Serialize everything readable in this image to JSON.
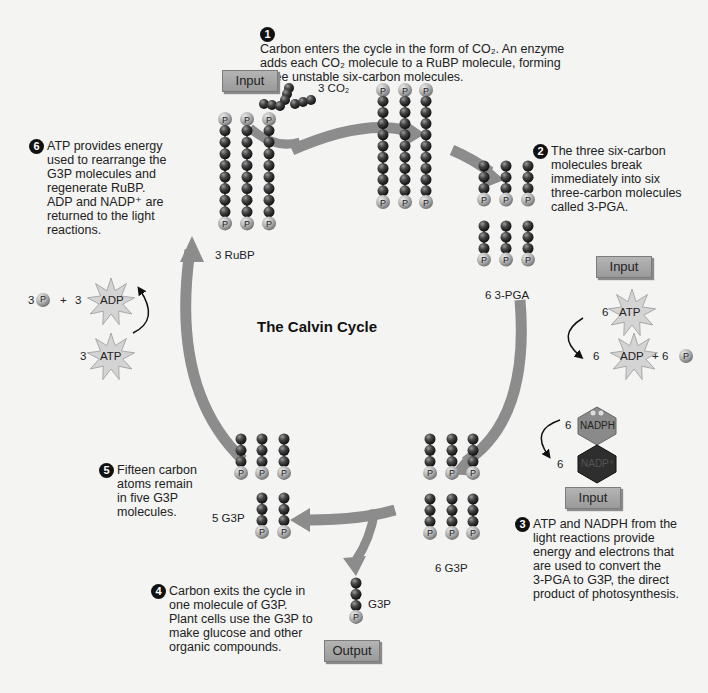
{
  "title": "The Calvin Cycle",
  "steps": [
    {
      "num": "1",
      "lines": [
        "Carbon enters the cycle in the form of CO₂. An enzyme",
        "adds each CO₂ molecule to a RuBP molecule, forming",
        "three unstable six-carbon molecules."
      ]
    },
    {
      "num": "2",
      "lines": [
        "The three six-carbon",
        "molecules break",
        "immediately into six",
        "three-carbon molecules",
        "called 3-PGA."
      ]
    },
    {
      "num": "3",
      "lines": [
        "ATP and NADPH from the",
        "light reactions provide",
        "energy and electrons that",
        "are used to convert the",
        "3-PGA to G3P, the direct",
        "product of photosynthesis."
      ]
    },
    {
      "num": "4",
      "lines": [
        "Carbon exits the cycle in",
        "one molecule of G3P.",
        "Plant cells use the G3P to",
        "make glucose and other",
        "organic compounds."
      ]
    },
    {
      "num": "5",
      "lines": [
        "Fifteen carbon",
        "atoms remain",
        "in five G3P",
        "molecules."
      ]
    },
    {
      "num": "6",
      "lines": [
        "ATP provides energy",
        "used to rearrange the",
        "G3P molecules and",
        "regenerate RuBP.",
        "ADP and NADP⁺ are",
        "returned to the light",
        "reactions."
      ]
    }
  ],
  "boxes": {
    "input_co2": "Input",
    "input_atp": "Input",
    "input_nadph": "Input",
    "output_g3p": "Output"
  },
  "molecule_labels": {
    "co2": "3 CO₂",
    "rubp": "3 RuBP",
    "pga": "6 3-PGA",
    "g3p6": "6 G3P",
    "g3p5": "5 G3P",
    "g3p_out": "G3P"
  },
  "atp_input": {
    "atp_count": "6",
    "atp": "ATP",
    "adp_count": "6",
    "adp": "ADP",
    "p_count": "+ 6",
    "p": "P"
  },
  "nadph_input": {
    "nadph_count": "6",
    "nadph": "NADPH",
    "nadp_count": "6",
    "nadp": "NADP⁺"
  },
  "regen": {
    "p_count": "3",
    "p": "P",
    "plus": "+",
    "adp_count": "3",
    "adp": "ADP",
    "atp_count": "3",
    "atp": "ATP"
  },
  "colors": {
    "arrow": "#8c8c8c",
    "carbon": "#3a3a3a",
    "phosphate": "#b8b8b8",
    "background": "#f4f4f3",
    "box": "#a8a8a8"
  }
}
